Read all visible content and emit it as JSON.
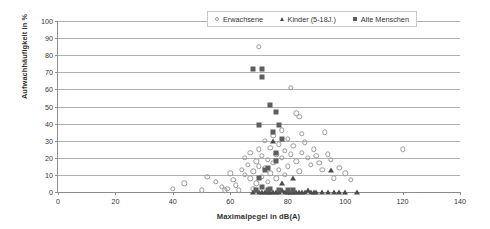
{
  "chart_data": {
    "type": "scatter",
    "title": "",
    "xlabel": "Maximalpegel in dB(A)",
    "ylabel": "Aufwachhäufigkeit in %",
    "xlim": [
      0,
      140
    ],
    "ylim": [
      0,
      100
    ],
    "xticks": [
      0,
      20,
      40,
      60,
      80,
      100,
      120,
      140
    ],
    "yticks": [
      0,
      10,
      20,
      30,
      40,
      50,
      60,
      70,
      80,
      90,
      100
    ],
    "grid": "horizontal",
    "legend_position": "top-right",
    "colors": {
      "adults_marker": "#9a9a9a",
      "children_marker": "#4a4a4a",
      "elderly_marker": "#5e5e5e",
      "gridline": "#b0b0b0",
      "axis": "#8c8c8c"
    },
    "series": [
      {
        "name": "Erwachsene",
        "marker": "open-circle",
        "points": [
          [
            40,
            2
          ],
          [
            44,
            5
          ],
          [
            50,
            1
          ],
          [
            57,
            3
          ],
          [
            58,
            1
          ],
          [
            59,
            2
          ],
          [
            52,
            9
          ],
          [
            55,
            6
          ],
          [
            60,
            11
          ],
          [
            61,
            7
          ],
          [
            62,
            4
          ],
          [
            63,
            1
          ],
          [
            64,
            13
          ],
          [
            65,
            10
          ],
          [
            65,
            20
          ],
          [
            66,
            16
          ],
          [
            67,
            8
          ],
          [
            67,
            23
          ],
          [
            68,
            2
          ],
          [
            68,
            12
          ],
          [
            69,
            18
          ],
          [
            69,
            5
          ],
          [
            70,
            15
          ],
          [
            70,
            25
          ],
          [
            70,
            85
          ],
          [
            71,
            21
          ],
          [
            71,
            9
          ],
          [
            72,
            30
          ],
          [
            72,
            14
          ],
          [
            73,
            19
          ],
          [
            73,
            6
          ],
          [
            74,
            26
          ],
          [
            74,
            11
          ],
          [
            75,
            33
          ],
          [
            75,
            17
          ],
          [
            76,
            22
          ],
          [
            76,
            8
          ],
          [
            77,
            28
          ],
          [
            77,
            13
          ],
          [
            78,
            36
          ],
          [
            78,
            20
          ],
          [
            79,
            24
          ],
          [
            79,
            10
          ],
          [
            80,
            31
          ],
          [
            80,
            15
          ],
          [
            81,
            61
          ],
          [
            81,
            22
          ],
          [
            82,
            27
          ],
          [
            83,
            46
          ],
          [
            83,
            18
          ],
          [
            84,
            44
          ],
          [
            84,
            12
          ],
          [
            85,
            34
          ],
          [
            85,
            23
          ],
          [
            86,
            29
          ],
          [
            87,
            20
          ],
          [
            88,
            16
          ],
          [
            89,
            25
          ],
          [
            90,
            21
          ],
          [
            91,
            17
          ],
          [
            92,
            13
          ],
          [
            93,
            35
          ],
          [
            94,
            22
          ],
          [
            95,
            19
          ],
          [
            96,
            8
          ],
          [
            98,
            14
          ],
          [
            100,
            11
          ],
          [
            102,
            7
          ],
          [
            120,
            25
          ]
        ]
      },
      {
        "name": "Kinder (5-18J.)",
        "marker": "filled-triangle",
        "points": [
          [
            68,
            0
          ],
          [
            70,
            0
          ],
          [
            71,
            0
          ],
          [
            72,
            0
          ],
          [
            73,
            0
          ],
          [
            74,
            0
          ],
          [
            75,
            0
          ],
          [
            76,
            0
          ],
          [
            77,
            0
          ],
          [
            78,
            1
          ],
          [
            79,
            0
          ],
          [
            80,
            0
          ],
          [
            81,
            0
          ],
          [
            82,
            0
          ],
          [
            83,
            0
          ],
          [
            84,
            0
          ],
          [
            85,
            0
          ],
          [
            86,
            0
          ],
          [
            87,
            1
          ],
          [
            88,
            0
          ],
          [
            89,
            0
          ],
          [
            90,
            0
          ],
          [
            92,
            0
          ],
          [
            94,
            0
          ],
          [
            96,
            0
          ],
          [
            98,
            0
          ],
          [
            100,
            0
          ],
          [
            104,
            0
          ],
          [
            78,
            5
          ],
          [
            82,
            8
          ],
          [
            75,
            30
          ],
          [
            95,
            13
          ]
        ]
      },
      {
        "name": "Alte Menschen",
        "marker": "filled-square",
        "points": [
          [
            68,
            72
          ],
          [
            71,
            72
          ],
          [
            71,
            67
          ],
          [
            70,
            39
          ],
          [
            74,
            51
          ],
          [
            76,
            47
          ],
          [
            77,
            39
          ],
          [
            78,
            31
          ],
          [
            76,
            23
          ],
          [
            76,
            18
          ],
          [
            73,
            14
          ],
          [
            72,
            13
          ],
          [
            70,
            8
          ],
          [
            71,
            3
          ],
          [
            74,
            2
          ],
          [
            77,
            1
          ],
          [
            80,
            1
          ],
          [
            82,
            1
          ],
          [
            69,
            1
          ],
          [
            73,
            1
          ],
          [
            75,
            35
          ]
        ]
      }
    ]
  }
}
